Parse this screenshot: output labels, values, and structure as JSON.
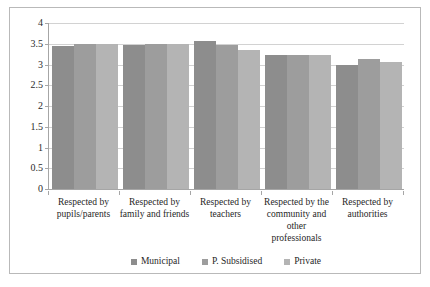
{
  "chart_data": {
    "type": "bar",
    "title": "",
    "subtitle": "",
    "xlabel": "",
    "ylabel": "",
    "ylim": [
      0,
      4
    ],
    "ytick_labels": [
      "0",
      "0.5",
      "1",
      "1.5",
      "2",
      "2.5",
      "3",
      "3.5",
      "4"
    ],
    "ytick_values": [
      0,
      0.5,
      1,
      1.5,
      2,
      2.5,
      3,
      3.5,
      4
    ],
    "grid": true,
    "legend_position": "bottom",
    "categories": [
      "Respected by pupils/parents",
      "Respected by family and friends",
      "Respected by teachers",
      "Respected by the community and other professionals",
      "Respected by authorities"
    ],
    "series": [
      {
        "name": "Municipal",
        "color": "#8d8d8d",
        "values": [
          3.44,
          3.46,
          3.57,
          3.22,
          2.99
        ]
      },
      {
        "name": "P. Subsidised",
        "color": "#9d9d9d",
        "values": [
          3.49,
          3.49,
          3.47,
          3.22,
          3.13
        ]
      },
      {
        "name": "Private",
        "color": "#b4b4b4",
        "values": [
          3.5,
          3.5,
          3.35,
          3.24,
          3.07
        ]
      }
    ]
  },
  "legend": {
    "items": [
      {
        "label": "Municipal",
        "color": "#8d8d8d"
      },
      {
        "label": "P. Subsidised",
        "color": "#9d9d9d"
      },
      {
        "label": "Private",
        "color": "#b4b4b4"
      }
    ]
  },
  "colors": {
    "municipal": "#8d8d8d",
    "p_subsidised": "#9d9d9d",
    "private": "#b4b4b4",
    "gridline": "#d2d2d2",
    "axis": "#a6a6a6",
    "frame": "#b9b9b9",
    "background": "#ffffff",
    "text": "#1f1f1f"
  }
}
